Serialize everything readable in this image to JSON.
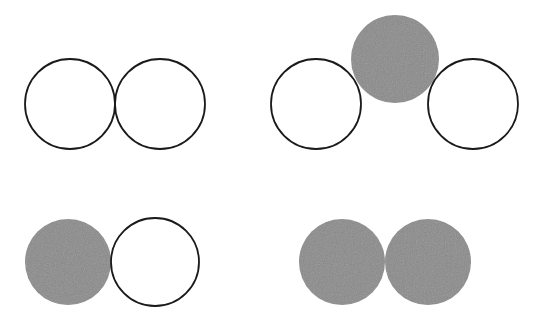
{
  "colors": {
    "background": "#ffffff",
    "outline": "#1a1a1a",
    "filled": "#8a8a8a"
  },
  "groups": [
    {
      "name": "top-left-pair",
      "circles": [
        {
          "cx": 70,
          "cy": 104,
          "r": 45,
          "filled": false
        },
        {
          "cx": 160,
          "cy": 104,
          "r": 45,
          "filled": false
        }
      ]
    },
    {
      "name": "top-right-triple",
      "circles": [
        {
          "cx": 316,
          "cy": 104,
          "r": 45,
          "filled": false
        },
        {
          "cx": 395,
          "cy": 59,
          "r": 44,
          "filled": true
        },
        {
          "cx": 473,
          "cy": 104,
          "r": 45,
          "filled": false
        }
      ]
    },
    {
      "name": "bottom-left-pair",
      "circles": [
        {
          "cx": 68,
          "cy": 262,
          "r": 43,
          "filled": true
        },
        {
          "cx": 155,
          "cy": 262,
          "r": 44,
          "filled": false
        }
      ]
    },
    {
      "name": "bottom-right-pair",
      "circles": [
        {
          "cx": 342,
          "cy": 262,
          "r": 43,
          "filled": true
        },
        {
          "cx": 428,
          "cy": 262,
          "r": 43,
          "filled": true
        }
      ]
    }
  ]
}
